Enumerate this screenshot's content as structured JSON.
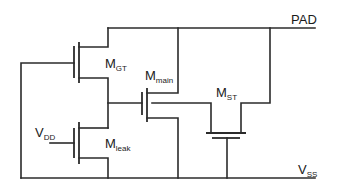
{
  "diagram": {
    "type": "circuit-schematic",
    "nodes": {
      "pad": {
        "label": "PAD"
      },
      "vss": {
        "label_main": "V",
        "label_sub": "SS"
      },
      "vdd": {
        "label_main": "V",
        "label_sub": "DD"
      }
    },
    "transistors": [
      {
        "id": "m_gt",
        "label_main": "M",
        "label_sub": "GT"
      },
      {
        "id": "m_main",
        "label_main": "M",
        "label_sub": "main"
      },
      {
        "id": "m_leak",
        "label_main": "M",
        "label_sub": "leak"
      },
      {
        "id": "m_st",
        "label_main": "M",
        "label_sub": "ST"
      }
    ],
    "colors": {
      "wire": "#2b2b2b",
      "background": "#ffffff",
      "text": "#1a1a1a"
    }
  }
}
